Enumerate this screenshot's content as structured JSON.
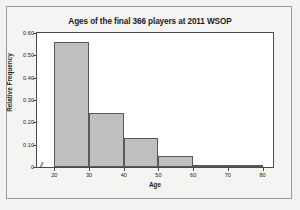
{
  "chart_data": {
    "type": "bar",
    "title": "Ages of the final 366 players at 2011 WSOP",
    "xlabel": "Age",
    "ylabel": "Relative Frequency",
    "categories": [
      "20-30",
      "30-40",
      "40-50",
      "50-60",
      "60-70",
      "70-80"
    ],
    "bin_edges": [
      20,
      30,
      40,
      50,
      60,
      70,
      80
    ],
    "values": [
      0.56,
      0.24,
      0.13,
      0.05,
      0.01,
      0.0
    ],
    "xlim": [
      15,
      83
    ],
    "ylim": [
      0,
      0.6
    ],
    "xticks": [
      "20",
      "30",
      "40",
      "50",
      "60",
      "70",
      "80"
    ],
    "xtick_values": [
      20,
      30,
      40,
      50,
      60,
      70,
      80
    ],
    "yticks": [
      "0",
      "0.10",
      "0.20",
      "0.30",
      "0.40",
      "0.50",
      "0.60"
    ],
    "ytick_values": [
      0,
      0.1,
      0.2,
      0.3,
      0.4,
      0.5,
      0.6
    ],
    "grid": false,
    "legend": null,
    "bar_fill_color": "#bfbfbf",
    "bar_edge_color": "#595959",
    "plot_background": "#ffffff",
    "figure_background": "#f2f2f0",
    "axis_break_symbol": "//"
  }
}
